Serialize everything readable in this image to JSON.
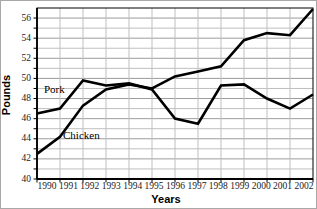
{
  "chart_data": {
    "type": "line",
    "title": "",
    "xlabel": "Years",
    "ylabel": "Pounds",
    "x": [
      1990,
      1991,
      1992,
      1993,
      1994,
      1995,
      1996,
      1997,
      1998,
      1999,
      2000,
      2001,
      2002
    ],
    "xtick_labels": [
      "1990",
      "1991",
      "1992",
      "1993",
      "1994",
      "1995",
      "1996",
      "1997",
      "1998",
      "1999",
      "2000",
      "2001",
      "2002"
    ],
    "ylim": [
      40,
      57
    ],
    "yticks": [
      40,
      42,
      44,
      46,
      48,
      50,
      52,
      54,
      56
    ],
    "ytick_labels": [
      "40",
      "42",
      "44",
      "46",
      "48",
      "50",
      "52",
      "54",
      "56"
    ],
    "grid": true,
    "grid_minor_y_step": 1,
    "legend_position": "inline-labels",
    "series": [
      {
        "name": "Pork",
        "color": "#000000",
        "values": [
          46.5,
          47.0,
          49.8,
          49.3,
          49.5,
          48.9,
          46.0,
          45.5,
          49.3,
          49.4,
          48.0,
          47.0,
          48.4
        ]
      },
      {
        "name": "Chicken",
        "color": "#000000",
        "values": [
          42.5,
          44.2,
          47.3,
          48.9,
          49.4,
          49.0,
          50.2,
          50.7,
          51.2,
          53.8,
          54.5,
          54.3,
          56.9
        ]
      }
    ],
    "colors": {
      "grid_light": "#bfbfbf",
      "grid_dark": "#9c9c9c",
      "axis": "#000000",
      "line": "#000000"
    }
  }
}
